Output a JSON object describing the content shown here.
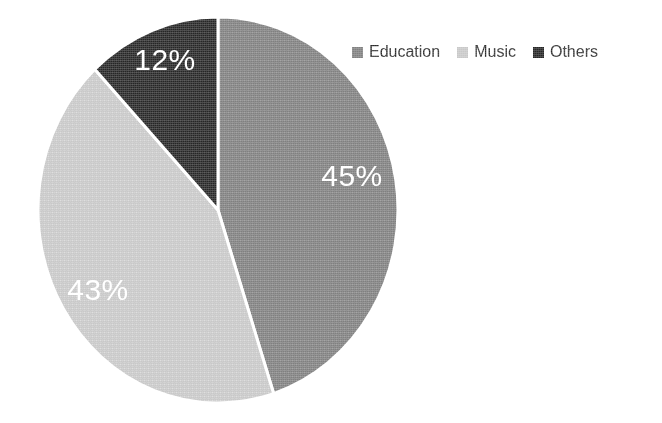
{
  "chart_data": {
    "type": "pie",
    "title": "",
    "subtitle": "",
    "xlabel": "",
    "ylabel": "",
    "grid": false,
    "legend_position": "top-right",
    "legend_orientation": "horizontal",
    "start_angle_deg": 0,
    "direction": "clockwise",
    "categories": [
      "Education",
      "Music",
      "Others"
    ],
    "values": [
      45,
      43,
      12
    ],
    "value_unit": "%",
    "data_labels": [
      "45%",
      "43%",
      "12%"
    ],
    "colors": [
      "#808080",
      "#c8c8c8",
      "#262626"
    ],
    "slices": [
      {
        "name": "Education",
        "value": 45,
        "label": "45%",
        "color": "#808080",
        "start_deg": 0,
        "end_deg": 162,
        "label_x": 352,
        "label_y": 186
      },
      {
        "name": "Music",
        "value": 43,
        "label": "43%",
        "color": "#c8c8c8",
        "start_deg": 162,
        "end_deg": 316.8,
        "label_x": 98,
        "label_y": 300
      },
      {
        "name": "Others",
        "value": 12,
        "label": "12%",
        "color": "#262626",
        "start_deg": 316.8,
        "end_deg": 360,
        "label_x": 165,
        "label_y": 70
      }
    ],
    "geometry": {
      "center_x": 218,
      "center_y": 210,
      "radius_x": 180,
      "radius_y": 193
    }
  },
  "legend": {
    "items": [
      {
        "label": "Education",
        "color": "#808080",
        "swatch_name": "legend-swatch-education"
      },
      {
        "label": "Music",
        "color": "#c8c8c8",
        "swatch_name": "legend-swatch-music"
      },
      {
        "label": "Others",
        "color": "#262626",
        "swatch_name": "legend-swatch-others"
      }
    ]
  },
  "background_color": "#ffffff",
  "label_text_color": "#ffffff",
  "legend_text_color": "#2b2b2b"
}
